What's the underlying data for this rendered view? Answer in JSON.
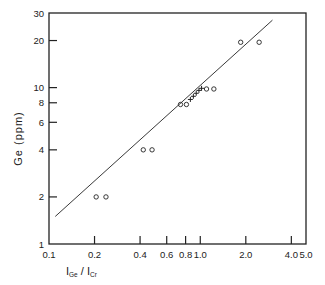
{
  "chart_data": {
    "type": "scatter",
    "title": "",
    "xlabel": "I_Ge / I_Cr",
    "xlabel_parts": {
      "main1": "I",
      "sub1": "Ge",
      "slash": " / ",
      "main2": "I",
      "sub2": "Cr"
    },
    "ylabel": "Ge (ppm)",
    "xscale": "log",
    "yscale": "log",
    "xlim": [
      0.1,
      5.0
    ],
    "ylim": [
      1,
      30
    ],
    "grid": false,
    "legend": null,
    "x_ticks": [
      {
        "value": 0.1,
        "label": "0.1"
      },
      {
        "value": 0.2,
        "label": "0.2"
      },
      {
        "value": 0.4,
        "label": "0.4"
      },
      {
        "value": 0.6,
        "label": "0.6"
      },
      {
        "value": 0.8,
        "label": "0.8"
      },
      {
        "value": 1.0,
        "label": "1.0"
      },
      {
        "value": 2.0,
        "label": "2.0"
      },
      {
        "value": 4.0,
        "label": "4.0"
      },
      {
        "value": 5.0,
        "label": "5.0"
      }
    ],
    "y_ticks": [
      {
        "value": 1,
        "label": "1"
      },
      {
        "value": 2,
        "label": "2"
      },
      {
        "value": 4,
        "label": "4"
      },
      {
        "value": 6,
        "label": "6"
      },
      {
        "value": 8,
        "label": "8"
      },
      {
        "value": 10,
        "label": "10"
      },
      {
        "value": 20,
        "label": "20"
      },
      {
        "value": 30,
        "label": "30"
      }
    ],
    "series": [
      {
        "name": "standards (circles)",
        "marker": "open-circle",
        "points": [
          {
            "x": 0.205,
            "y": 2.0
          },
          {
            "x": 0.238,
            "y": 2.0
          },
          {
            "x": 0.42,
            "y": 4.0
          },
          {
            "x": 0.48,
            "y": 4.0
          },
          {
            "x": 0.74,
            "y": 7.8
          },
          {
            "x": 0.81,
            "y": 7.8
          },
          {
            "x": 1.1,
            "y": 9.8
          },
          {
            "x": 1.23,
            "y": 9.8
          },
          {
            "x": 1.85,
            "y": 19.5
          },
          {
            "x": 2.45,
            "y": 19.5
          }
        ]
      },
      {
        "name": "samples (crosses)",
        "marker": "cross",
        "points": [
          {
            "x": 0.86,
            "y": 8.4
          },
          {
            "x": 0.9,
            "y": 8.8
          },
          {
            "x": 0.94,
            "y": 9.2
          },
          {
            "x": 0.98,
            "y": 9.6
          },
          {
            "x": 1.02,
            "y": 9.9
          }
        ]
      },
      {
        "name": "fit line",
        "type": "line",
        "points": [
          {
            "x": 0.11,
            "y": 1.5
          },
          {
            "x": 3.0,
            "y": 27.0
          }
        ]
      }
    ]
  },
  "colors": {
    "ink": "#222222",
    "background": "#ffffff"
  }
}
